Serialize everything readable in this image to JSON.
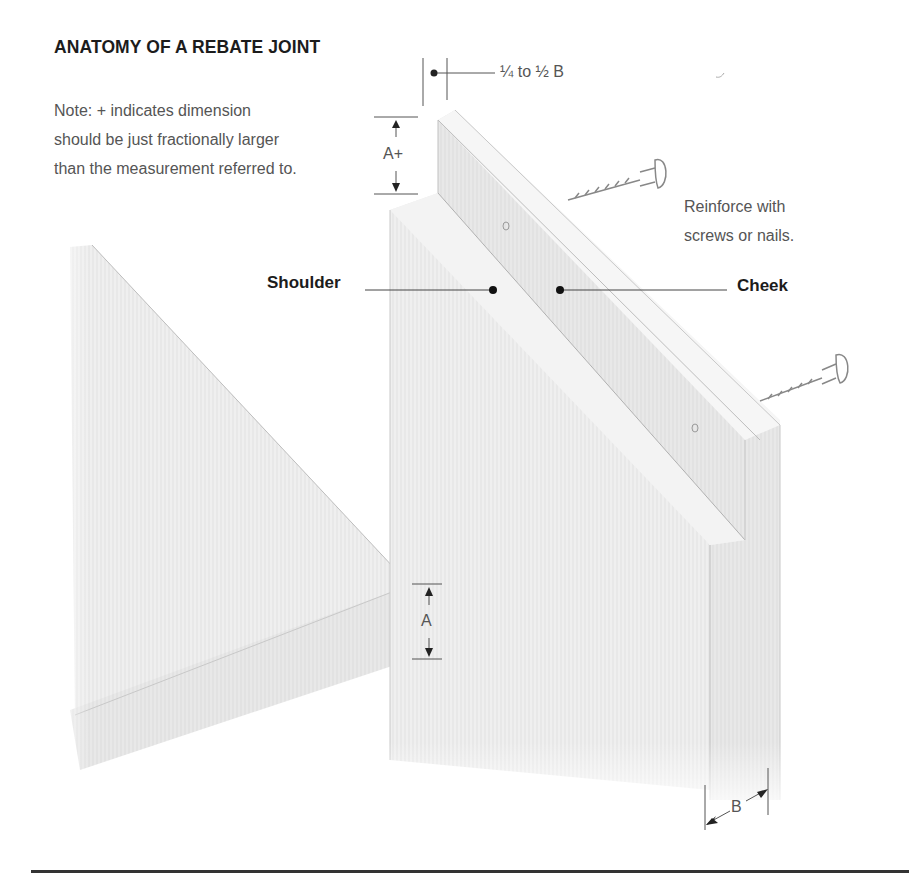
{
  "figure": {
    "title": "ANATOMY OF A REBATE JOINT",
    "note_lines": [
      "Note: + indicates dimension",
      "should be just fractionally larger",
      "than the measurement referred to."
    ],
    "reinforce_lines": [
      "Reinforce with",
      "screws or nails."
    ]
  },
  "labels": {
    "rebate_width": "¼ to ½ B",
    "rebate_depth": "A+",
    "board_thickness": "A",
    "board_width": "B",
    "shoulder": "Shoulder",
    "cheek": "Cheek"
  },
  "colors": {
    "text_dark": "#1c1c1c",
    "text_light": "#555555",
    "wood_light": "#f1f1f1",
    "wood_mid": "#e6e6e6",
    "wood_edge": "#dadada",
    "line": "#333333"
  }
}
